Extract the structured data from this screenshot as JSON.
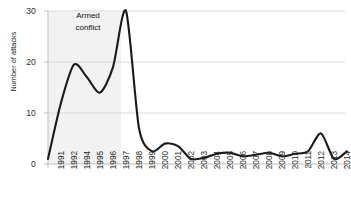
{
  "chart_data": {
    "type": "line",
    "title": "",
    "xlabel": "",
    "ylabel": "Number of attacks",
    "ylim": [
      0,
      30
    ],
    "yticks": [
      0,
      10,
      20,
      30
    ],
    "grid": true,
    "legend": null,
    "xtick_labels": [
      "1991",
      "1992",
      "1994",
      "1995",
      "1996",
      "1997",
      "1998",
      "1999",
      "2000",
      "2001",
      "2002",
      "2003",
      "2004",
      "2005",
      "2006",
      "2007",
      "2008",
      "2009",
      "2010",
      "2011",
      "2012",
      "2013",
      "2014"
    ],
    "x": [
      1991,
      1992,
      1993,
      1994,
      1995,
      1996,
      1997,
      1998,
      1999,
      2000,
      2001,
      2002,
      2003,
      2004,
      2005,
      2006,
      2007,
      2008,
      2009,
      2010,
      2011,
      2012,
      2013,
      2014
    ],
    "values": [
      1,
      12,
      19.5,
      17,
      14,
      19,
      30,
      7,
      2.5,
      4,
      3.5,
      1,
      1.2,
      2,
      2.2,
      1.5,
      1.8,
      2.2,
      1.5,
      2,
      2.5,
      6,
      1,
      2.5
    ],
    "series_name": "Number of attacks",
    "line_color": "#1a1a1a",
    "annotations": [
      {
        "text_line1": "Armed",
        "text_line2": "conflict",
        "type": "shaded-band",
        "band_start": 1991,
        "band_end": 1998,
        "band_color": "#f2f2f2"
      }
    ]
  },
  "axis": {
    "y_label": "Number of attacks",
    "y_tick_30": "30",
    "y_tick_20": "20",
    "y_tick_10": "10",
    "y_tick_0": "0"
  },
  "annotation": {
    "line1": "Armed",
    "line2": "conflict"
  }
}
